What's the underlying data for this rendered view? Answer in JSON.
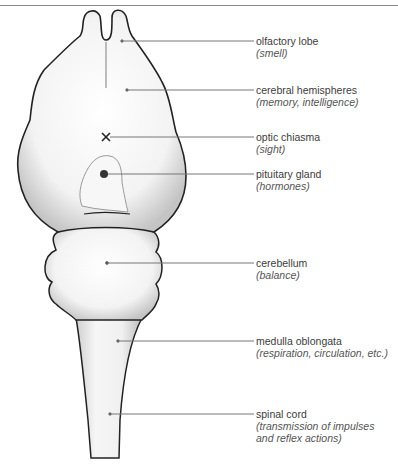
{
  "diagram": {
    "colors": {
      "outline": "#222222",
      "leader_line": "#777777",
      "text": "#3c3c3c",
      "fill": "#f4f4f4",
      "shade": "#b8b8b8"
    },
    "labels": [
      {
        "name": "olfactory lobe",
        "function": "(smell)"
      },
      {
        "name": "cerebral hemispheres",
        "function": "(memory, intelligence)"
      },
      {
        "name": "optic chiasma",
        "function": "(sight)"
      },
      {
        "name": "pituitary gland",
        "function": "(hormones)"
      },
      {
        "name": "cerebellum",
        "function": "(balance)"
      },
      {
        "name": "medulla oblongata",
        "function": "(respiration, circulation, etc.)"
      },
      {
        "name": "spinal cord",
        "function_line1": "(transmission of impulses",
        "function_line2": "and reflex actions)"
      }
    ]
  }
}
